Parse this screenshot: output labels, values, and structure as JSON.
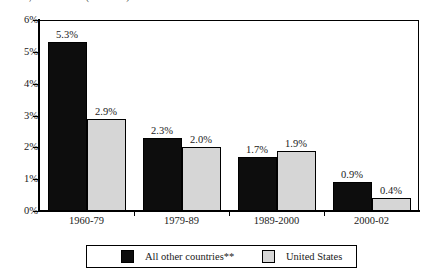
{
  "chart_data": {
    "type": "bar",
    "title": "",
    "title_clipped_fragment": "Table, Chart or Box (continued)",
    "xlabel": "",
    "ylabel": "",
    "ylim": [
      0,
      6
    ],
    "y_tick_labels": [
      "0%",
      "1%",
      "2%",
      "3%",
      "4%",
      "5%",
      "6%"
    ],
    "y_tick_values": [
      0,
      1,
      2,
      3,
      4,
      5,
      6
    ],
    "grid": false,
    "legend_position": "bottom",
    "categories": [
      "1960-79",
      "1979-89",
      "1989-2000",
      "2000-02"
    ],
    "series": [
      {
        "name": "All other countries**",
        "color": "#0d0d0d",
        "values": [
          5.3,
          2.3,
          1.7,
          0.9
        ],
        "labels": [
          "5.3%",
          "2.3%",
          "1.7%",
          "0.9%"
        ]
      },
      {
        "name": "United States",
        "color": "#d6d6d6",
        "values": [
          2.9,
          2.0,
          1.9,
          0.4
        ],
        "labels": [
          "2.9%",
          "2.0%",
          "1.9%",
          "0.4%"
        ]
      }
    ]
  }
}
